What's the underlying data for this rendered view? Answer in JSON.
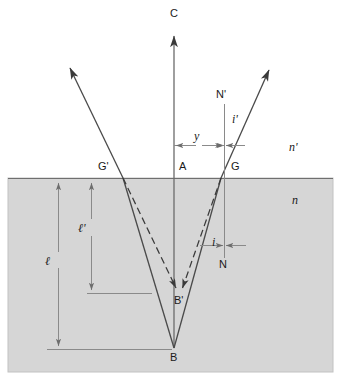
{
  "figure": {
    "type": "optics-ray-diagram",
    "canvas": {
      "width": 341,
      "height": 379
    },
    "colors": {
      "background": "#ffffff",
      "medium_fill": "#d6d6d6",
      "medium_border": "#b8b8b8",
      "ray_stroke": "#4a4a4a",
      "dimension_stroke": "#7a7a7a",
      "label_text": "#1a1a1a",
      "interface_line": "#6f6f6f"
    }
  },
  "labels": {
    "axis_top": "C",
    "point_A": "A",
    "point_B": "B",
    "point_B_prime": "B'",
    "point_G": "G",
    "point_G_prime": "G'",
    "normal_N": "N",
    "normal_N_prime": "N'",
    "angle_i": "i",
    "angle_i_prime": "i'",
    "index_n": "n",
    "index_n_prime": "n'",
    "depth_l": "ℓ",
    "depth_l_prime": "ℓ'",
    "offset_y": "y"
  },
  "geometry": {
    "interface_y": 178,
    "medium_rect": {
      "x": 8,
      "y": 178,
      "width": 325,
      "height": 194
    },
    "axis_x": 174,
    "axis_top_y": 28,
    "point_A": {
      "x": 174,
      "y": 178
    },
    "point_B": {
      "x": 174,
      "y": 348
    },
    "point_B_prime": {
      "x": 179,
      "y": 292
    },
    "point_G": {
      "x": 221,
      "y": 178
    },
    "point_G_prime": {
      "x": 123,
      "y": 178
    },
    "normal_N_x": 224,
    "normal_N_top_y": 104,
    "normal_N_bottom_y": 258,
    "ray_right_tip": {
      "x": 272,
      "y": 64
    },
    "ray_left_tip": {
      "x": 67,
      "y": 62
    },
    "dim_y_left": 175,
    "dim_y_right": 224,
    "dim_y_row": 145,
    "dim_l_x": 58,
    "dim_l_top": 180,
    "dim_l_bottom": 350,
    "dim_l_baseline_x2": 172,
    "dim_l_prime_x": 91,
    "dim_l_prime_top": 180,
    "dim_l_prime_bottom": 294,
    "dim_l_prime_baseline_x2": 152
  },
  "label_positions": {
    "axis_top": {
      "x": 170,
      "y": 8
    },
    "point_A": {
      "x": 179,
      "y": 161
    },
    "point_B": {
      "x": 170,
      "y": 352
    },
    "point_B_prime": {
      "x": 174,
      "y": 295
    },
    "point_G": {
      "x": 231,
      "y": 161
    },
    "point_G_prime": {
      "x": 98,
      "y": 161
    },
    "normal_N": {
      "x": 219,
      "y": 259
    },
    "normal_N_prime": {
      "x": 216,
      "y": 89
    },
    "angle_i": {
      "x": 212,
      "y": 236
    },
    "angle_i_prime": {
      "x": 232,
      "y": 113
    },
    "index_n": {
      "x": 292,
      "y": 194
    },
    "index_n_prime": {
      "x": 289,
      "y": 141
    },
    "depth_l": {
      "x": 45,
      "y": 258
    },
    "depth_l_prime": {
      "x": 78,
      "y": 225
    },
    "offset_y": {
      "x": 194,
      "y": 130
    }
  }
}
